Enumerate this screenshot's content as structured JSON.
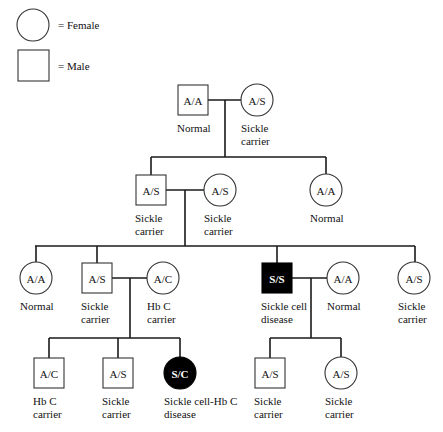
{
  "legend": {
    "female_label": "= Female",
    "male_label": "= Male"
  },
  "colors": {
    "line": "#1a1a1a",
    "affected_fill": "#000000",
    "unaffected_fill": "#ffffff"
  },
  "individuals": [
    {
      "id": "I-1",
      "sex": "male",
      "genotype": "A/A",
      "label": [
        "Normal"
      ],
      "affected": false,
      "x": 193,
      "y": 100
    },
    {
      "id": "I-2",
      "sex": "female",
      "genotype": "A/S",
      "label": [
        "Sickle",
        "carrier"
      ],
      "affected": false,
      "x": 257,
      "y": 100
    },
    {
      "id": "II-1",
      "sex": "male",
      "genotype": "A/S",
      "label": [
        "Sickle",
        "carrier"
      ],
      "affected": false,
      "x": 151,
      "y": 190
    },
    {
      "id": "II-2",
      "sex": "female",
      "genotype": "A/S",
      "label": [
        "Sickle",
        "carrier"
      ],
      "affected": false,
      "x": 220,
      "y": 190
    },
    {
      "id": "II-3",
      "sex": "female",
      "genotype": "A/A",
      "label": [
        "Normal"
      ],
      "affected": false,
      "x": 326,
      "y": 190
    },
    {
      "id": "III-1",
      "sex": "female",
      "genotype": "A/A",
      "label": [
        "Normal"
      ],
      "affected": false,
      "x": 36,
      "y": 278
    },
    {
      "id": "III-2",
      "sex": "male",
      "genotype": "A/S",
      "label": [
        "Sickle",
        "carrier"
      ],
      "affected": false,
      "x": 97,
      "y": 278
    },
    {
      "id": "III-3",
      "sex": "female",
      "genotype": "A/C",
      "label": [
        "Hb C",
        "carrier"
      ],
      "affected": false,
      "x": 163,
      "y": 278
    },
    {
      "id": "III-4",
      "sex": "male",
      "genotype": "S/S",
      "label": [
        "Sickle cell",
        "disease"
      ],
      "affected": true,
      "x": 277,
      "y": 278
    },
    {
      "id": "III-5",
      "sex": "female",
      "genotype": "A/A",
      "label": [
        "Normal"
      ],
      "affected": false,
      "x": 343,
      "y": 278
    },
    {
      "id": "III-6",
      "sex": "female",
      "genotype": "A/S",
      "label": [
        "Sickle",
        "carrier"
      ],
      "affected": false,
      "x": 414,
      "y": 278
    },
    {
      "id": "IV-1",
      "sex": "male",
      "genotype": "A/C",
      "label": [
        "Hb C",
        "carrier"
      ],
      "affected": false,
      "x": 49,
      "y": 373
    },
    {
      "id": "IV-2",
      "sex": "male",
      "genotype": "A/S",
      "label": [
        "Sickle",
        "carrier"
      ],
      "affected": false,
      "x": 118,
      "y": 373
    },
    {
      "id": "IV-3",
      "sex": "female",
      "genotype": "S/C",
      "label": [
        "Sickle cell-Hb C",
        "disease"
      ],
      "affected": true,
      "x": 180,
      "y": 373
    },
    {
      "id": "IV-4",
      "sex": "male",
      "genotype": "A/S",
      "label": [
        "Sickle",
        "carrier"
      ],
      "affected": false,
      "x": 270,
      "y": 373
    },
    {
      "id": "IV-5",
      "sex": "female",
      "genotype": "A/S",
      "label": [
        "Sickle",
        "carrier"
      ],
      "affected": false,
      "x": 341,
      "y": 373
    }
  ],
  "lines": [
    [
      208,
      100,
      241,
      100
    ],
    [
      225,
      100,
      225,
      157
    ],
    [
      151,
      157,
      326,
      157
    ],
    [
      151,
      157,
      151,
      175
    ],
    [
      326,
      157,
      326,
      174
    ],
    [
      166,
      190,
      204,
      190
    ],
    [
      185,
      190,
      185,
      246
    ],
    [
      35,
      246,
      415,
      246
    ],
    [
      36,
      246,
      36,
      262
    ],
    [
      97,
      246,
      97,
      263
    ],
    [
      277,
      246,
      277,
      263
    ],
    [
      415,
      246,
      415,
      262
    ],
    [
      112,
      278,
      147,
      278
    ],
    [
      130,
      278,
      130,
      338
    ],
    [
      49,
      338,
      180,
      338
    ],
    [
      49,
      338,
      49,
      358
    ],
    [
      118,
      338,
      118,
      358
    ],
    [
      180,
      338,
      180,
      357
    ],
    [
      292,
      278,
      327,
      278
    ],
    [
      311,
      278,
      311,
      338
    ],
    [
      270,
      338,
      341,
      338
    ],
    [
      270,
      338,
      270,
      358
    ],
    [
      341,
      338,
      341,
      357
    ]
  ]
}
